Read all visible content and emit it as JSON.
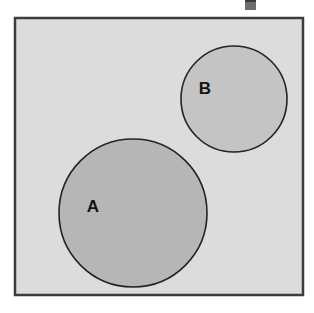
{
  "figure": {
    "type": "venn-diagram",
    "width": 314,
    "height": 313,
    "background_color": "#ffffff"
  },
  "universe": {
    "name": "universal-set-rectangle",
    "x": 15,
    "y": 18,
    "width": 288,
    "height": 277,
    "fill_color": "#dcdcdc",
    "stroke_color": "#3c3c3c",
    "stroke_width": 2.5
  },
  "sets": [
    {
      "label": "A",
      "name": "set-a",
      "cx": 133,
      "cy": 213,
      "r": 74,
      "fill_color": "#b6b6b6",
      "stroke_color": "#232323",
      "stroke_width": 1.6,
      "label_x": 93,
      "label_y": 208
    },
    {
      "label": "B",
      "name": "set-b",
      "cx": 234,
      "cy": 99,
      "r": 53,
      "fill_color": "#c4c4c4",
      "stroke_color": "#232323",
      "stroke_width": 1.6,
      "label_x": 205,
      "label_y": 90
    }
  ],
  "artifact": {
    "name": "scan-artifact",
    "x": 245,
    "y": 0,
    "width": 11,
    "height": 8,
    "color": "#6e6e6e"
  },
  "chart_data": {
    "type": "venn",
    "title": "",
    "sets": [
      "A",
      "B"
    ],
    "relationship": "disjoint",
    "intersection": 0,
    "legend": [],
    "annotations": [
      "A",
      "B"
    ]
  }
}
